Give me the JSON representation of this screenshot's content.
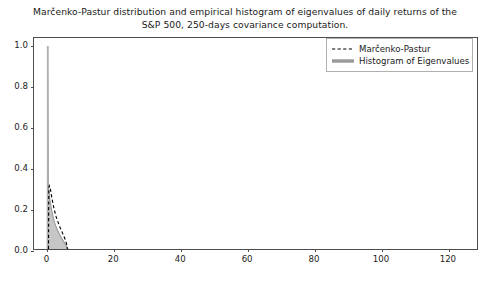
{
  "chart_data": {
    "type": "line",
    "title": "Marčenko-Pastur distribution and empirical histogram of eigenvalues of daily returns of the S&P 500, 250-days covariance computation.",
    "title_line1": "Marčenko-Pastur distribution and empirical histogram of eigenvalues of daily returns of the",
    "title_line2": "S&P 500, 250-days covariance computation.",
    "xlabel": "",
    "ylabel": "",
    "xlim": [
      -4,
      129
    ],
    "ylim": [
      0.0,
      1.04
    ],
    "grid": false,
    "legend_position": "upper right",
    "xticks": [
      0,
      20,
      40,
      60,
      80,
      100,
      120
    ],
    "xticklabels": [
      "0",
      "20",
      "40",
      "60",
      "80",
      "100",
      "120"
    ],
    "yticks": [
      0.0,
      0.2,
      0.4,
      0.6,
      0.8,
      1.0
    ],
    "yticklabels": [
      "0.0",
      "0.2",
      "0.4",
      "0.6",
      "0.8",
      "1.0"
    ],
    "series": [
      {
        "name": "Marčenko-Pastur",
        "style": "dashed",
        "color": "#000000",
        "x": [
          0.35,
          0.45,
          0.6,
          0.8,
          1.0,
          1.2,
          1.5,
          1.8,
          2.2,
          2.6,
          3.0,
          3.4,
          3.8,
          4.2,
          4.6,
          5.0,
          5.4,
          5.7,
          5.9,
          6.0
        ],
        "y": [
          0.0,
          0.3,
          0.312,
          0.305,
          0.288,
          0.268,
          0.24,
          0.215,
          0.186,
          0.162,
          0.142,
          0.124,
          0.107,
          0.092,
          0.077,
          0.062,
          0.045,
          0.03,
          0.015,
          0.0
        ]
      },
      {
        "name": "Histogram of Eigenvalues",
        "style": "solid",
        "color": "#999999",
        "description": "light-grey filled empirical density; narrow tall spike near zero reaching 1.0 plus a small decaying shoulder out to about 6",
        "spike_x": 0.1,
        "spike_height": 1.0,
        "x": [
          0.0,
          0.15,
          0.3,
          0.5,
          0.8,
          1.1,
          1.5,
          2.0,
          2.5,
          3.0,
          3.5,
          4.0,
          4.5,
          5.0,
          5.5,
          6.0,
          6.3
        ],
        "y": [
          0.0,
          1.0,
          0.3,
          0.28,
          0.24,
          0.21,
          0.175,
          0.14,
          0.115,
          0.095,
          0.078,
          0.062,
          0.048,
          0.034,
          0.02,
          0.006,
          0.0
        ]
      }
    ],
    "legend": [
      {
        "label": "Marčenko-Pastur",
        "marker": "dashed-line",
        "color": "#000000"
      },
      {
        "label": "Histogram of Eigenvalues",
        "marker": "solid-thick-line",
        "color": "#999999"
      }
    ],
    "colors": {
      "marcenko_pastur": "#000000",
      "histogram_fill": "#b3b3b3",
      "histogram_edge": "#999999",
      "axis": "#4d4d4d",
      "text": "#1a1a1a",
      "background": "#ffffff"
    }
  }
}
